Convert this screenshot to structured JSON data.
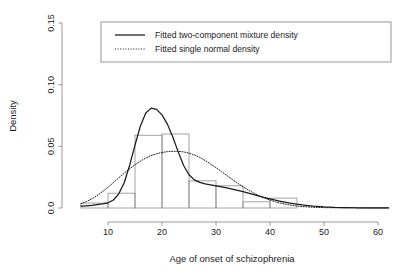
{
  "chart_data": {
    "type": "bar",
    "title": "",
    "subtitle": "",
    "xlabel": "Age of onset of schizophrenia",
    "ylabel": "Density",
    "xlim": [
      5,
      62
    ],
    "ylim": [
      0.0,
      0.15
    ],
    "grid": false,
    "x_ticks": [
      10,
      20,
      30,
      40,
      50,
      60
    ],
    "x_tick_labels": [
      "10",
      "20",
      "30",
      "40",
      "50",
      "60"
    ],
    "y_ticks": [
      0.0,
      0.05,
      0.1,
      0.15
    ],
    "y_tick_labels": [
      "0.0",
      "0.05",
      "0.10",
      "0.15"
    ],
    "histogram": {
      "name": "Histogram of age of onset",
      "bin_edges": [
        5,
        10,
        15,
        20,
        25,
        30,
        35,
        40,
        45
      ],
      "densities": [
        0.004,
        0.012,
        0.059,
        0.06,
        0.022,
        0.018,
        0.005,
        0.008
      ],
      "bin_labels": [
        "5-10",
        "10-15",
        "15-20",
        "20-25",
        "25-30",
        "30-35",
        "35-40",
        "40-45"
      ]
    },
    "series": [
      {
        "name": "Fitted two-component mixture density",
        "style": "solid",
        "color": "#1a1a1a",
        "x": [
          5,
          6,
          7,
          8,
          9,
          10,
          11,
          12,
          13,
          14,
          15,
          16,
          17,
          18,
          19,
          20,
          21,
          22,
          23,
          24,
          25,
          26,
          27,
          28,
          29,
          30,
          31,
          32,
          33,
          34,
          35,
          36,
          37,
          38,
          39,
          40,
          41,
          42,
          43,
          44,
          45,
          46,
          47,
          48,
          50,
          52,
          54,
          56,
          58,
          60,
          62
        ],
        "values": [
          0.0015,
          0.0018,
          0.0022,
          0.0027,
          0.0033,
          0.0042,
          0.0065,
          0.0115,
          0.0205,
          0.0345,
          0.051,
          0.0665,
          0.077,
          0.081,
          0.08,
          0.0755,
          0.068,
          0.0575,
          0.0455,
          0.0345,
          0.027,
          0.0228,
          0.0208,
          0.0196,
          0.0188,
          0.018,
          0.0172,
          0.0163,
          0.0153,
          0.0143,
          0.0132,
          0.012,
          0.0108,
          0.0096,
          0.0085,
          0.0074,
          0.0063,
          0.0054,
          0.0045,
          0.0038,
          0.0031,
          0.0025,
          0.002,
          0.0016,
          0.001,
          0.0006,
          0.0004,
          0.0002,
          0.0002,
          0.0001,
          0.0001
        ]
      },
      {
        "name": "Fitted single normal density",
        "style": "dotted",
        "color": "#1a1a1a",
        "x": [
          5,
          6,
          7,
          8,
          9,
          10,
          11,
          12,
          13,
          14,
          15,
          16,
          17,
          18,
          19,
          20,
          21,
          22,
          23,
          24,
          25,
          26,
          27,
          28,
          29,
          30,
          31,
          32,
          33,
          34,
          35,
          36,
          37,
          38,
          39,
          40,
          41,
          42,
          43,
          44,
          45,
          46,
          47,
          48,
          50,
          52,
          54,
          56,
          58,
          60,
          62
        ],
        "values": [
          0.0035,
          0.0052,
          0.0074,
          0.0101,
          0.0133,
          0.0168,
          0.0206,
          0.0245,
          0.0283,
          0.0318,
          0.035,
          0.038,
          0.0405,
          0.0425,
          0.044,
          0.045,
          0.0457,
          0.046,
          0.0459,
          0.0455,
          0.0445,
          0.043,
          0.041,
          0.0385,
          0.0357,
          0.0327,
          0.0296,
          0.0264,
          0.0232,
          0.0201,
          0.0172,
          0.0145,
          0.0121,
          0.0099,
          0.008,
          0.0064,
          0.005,
          0.0039,
          0.003,
          0.0022,
          0.0016,
          0.0012,
          0.0009,
          0.0006,
          0.0003,
          0.0002,
          0.0001,
          0.0001,
          0.0,
          0.0,
          0.0
        ]
      }
    ],
    "legend": {
      "position": "top",
      "entries": [
        {
          "label": "Fitted two-component mixture density",
          "style": "solid"
        },
        {
          "label": "Fitted single normal density",
          "style": "dotted"
        }
      ]
    }
  }
}
